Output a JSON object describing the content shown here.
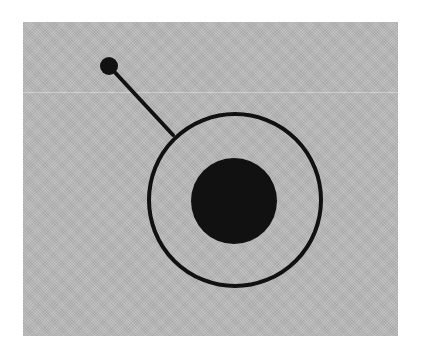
{
  "diagram": {
    "colors": {
      "background": "#ffffff",
      "panel": "#b9b9b9",
      "ink": "#111111"
    },
    "panel": {
      "x": 23,
      "y": 22,
      "width": 375,
      "height": 314
    },
    "outer_ring": {
      "cx": 235,
      "cy": 200,
      "r": 86,
      "stroke_width": 4
    },
    "nucleus": {
      "cx": 234,
      "cy": 201,
      "r": 43
    },
    "stalk": {
      "x1": 109,
      "y1": 66,
      "x2": 173,
      "y2": 135,
      "stroke_width": 4
    },
    "knob": {
      "cx": 109,
      "cy": 66,
      "r": 9
    }
  }
}
